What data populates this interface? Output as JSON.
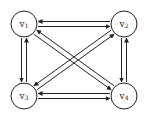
{
  "graph": {
    "type": "directed",
    "nodes": [
      {
        "id": "v1",
        "label": "v",
        "sub": "1"
      },
      {
        "id": "v2",
        "label": "v",
        "sub": "2"
      },
      {
        "id": "v3",
        "label": "v",
        "sub": "3"
      },
      {
        "id": "v4",
        "label": "v",
        "sub": "4"
      }
    ],
    "edges": [
      {
        "from": "v1",
        "to": "v2"
      },
      {
        "from": "v2",
        "to": "v1"
      },
      {
        "from": "v1",
        "to": "v3"
      },
      {
        "from": "v3",
        "to": "v1"
      },
      {
        "from": "v1",
        "to": "v4"
      },
      {
        "from": "v4",
        "to": "v1"
      },
      {
        "from": "v2",
        "to": "v3"
      },
      {
        "from": "v3",
        "to": "v2"
      },
      {
        "from": "v2",
        "to": "v4"
      },
      {
        "from": "v4",
        "to": "v2"
      },
      {
        "from": "v3",
        "to": "v4"
      },
      {
        "from": "v4",
        "to": "v3"
      }
    ]
  }
}
